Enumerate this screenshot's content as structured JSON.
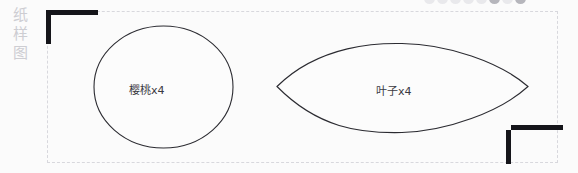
{
  "canvas": {
    "width": 578,
    "height": 173,
    "background_color": "#fbfbfb"
  },
  "side_label": {
    "name": "pattern-diagram-label",
    "text": "纸样图",
    "characters": [
      "纸",
      "样",
      "图"
    ],
    "color": "#cdcdd2"
  },
  "dot_row": {
    "count": 8,
    "color": "#e9e9ec",
    "highlight_color": "#b6b6bc",
    "highlight_index": 5
  },
  "frame": {
    "border_style": "dashed",
    "border_color": "#d8d8dd",
    "bracket_color": "#15151a"
  },
  "shapes": [
    {
      "id": "cherry",
      "type": "circle",
      "label": "樱桃x4",
      "stroke_color": "#2b2b31",
      "fill_color": "#fcfcfc"
    },
    {
      "id": "leaf",
      "type": "lens",
      "label": "叶子x4",
      "stroke_color": "#2b2b31",
      "fill_color": "#fcfcfc"
    }
  ]
}
